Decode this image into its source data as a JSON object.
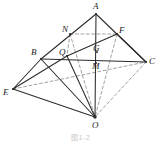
{
  "figure": {
    "type": "geometry-diagram",
    "caption": "图1-2",
    "stroke_color": "#2b2b2b",
    "dashed_color": "#8a8a8a",
    "label_color": "#1b1b1b",
    "points": [
      {
        "id": "A",
        "label": "A",
        "x": 96,
        "y": 14,
        "label_x": 93,
        "label_y": 2
      },
      {
        "id": "B",
        "label": "B",
        "x": 41,
        "y": 59,
        "label_x": 31,
        "label_y": 48
      },
      {
        "id": "C",
        "label": "C",
        "x": 146,
        "y": 62,
        "label_x": 149,
        "label_y": 57
      },
      {
        "id": "E",
        "label": "E",
        "x": 13,
        "y": 89,
        "label_x": 3,
        "label_y": 88
      },
      {
        "id": "O",
        "label": "O",
        "x": 95,
        "y": 117,
        "label_x": 92,
        "label_y": 121
      },
      {
        "id": "N",
        "label": "N",
        "x": 70,
        "y": 34,
        "label_x": 62,
        "label_y": 25
      },
      {
        "id": "F",
        "label": "F",
        "x": 117,
        "y": 34,
        "label_x": 119,
        "label_y": 26
      },
      {
        "id": "Q",
        "label": "Q",
        "x": 67,
        "y": 56,
        "label_x": 59,
        "label_y": 48
      },
      {
        "id": "G",
        "label": "G",
        "x": 97,
        "y": 52,
        "label_x": 93,
        "label_y": 44
      },
      {
        "id": "M",
        "label": "M",
        "x": 96,
        "y": 63,
        "label_x": 92,
        "label_y": 62
      }
    ],
    "solid_edges": [
      {
        "name": "A-B",
        "from": "A",
        "to": "B"
      },
      {
        "name": "A-C",
        "from": "A",
        "to": "C"
      },
      {
        "name": "A-O",
        "from": "A",
        "to": "O"
      },
      {
        "name": "B-C",
        "from": "B",
        "to": "C"
      },
      {
        "name": "B-E",
        "from": "B",
        "to": "E"
      },
      {
        "name": "B-O",
        "from": "B",
        "to": "O"
      },
      {
        "name": "E-Q",
        "from": "E",
        "to": "Q"
      },
      {
        "name": "E-O",
        "from": "E",
        "to": "O"
      },
      {
        "name": "Q-O",
        "from": "Q",
        "to": "O"
      },
      {
        "name": "Q-F",
        "from": "Q",
        "to": "F"
      },
      {
        "name": "F-C",
        "from": "F",
        "to": "C"
      }
    ],
    "dashed_edges": [
      {
        "name": "N-F",
        "from": "N",
        "to": "F"
      },
      {
        "name": "N-Q",
        "from": "N",
        "to": "Q"
      },
      {
        "name": "N-O",
        "from": "N",
        "to": "O"
      },
      {
        "name": "F-O",
        "from": "F",
        "to": "O"
      },
      {
        "name": "C-O",
        "from": "C",
        "to": "O"
      },
      {
        "name": "E-C",
        "from": "E",
        "to": "C"
      }
    ]
  }
}
